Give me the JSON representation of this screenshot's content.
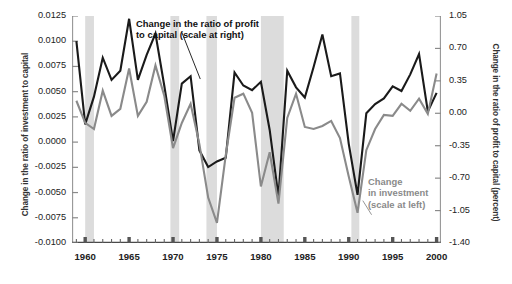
{
  "chart_data": {
    "type": "line",
    "title": "",
    "xlabel": "",
    "grid": false,
    "legend_position": "inline-annotations",
    "x": [
      1959,
      1960,
      1961,
      1962,
      1963,
      1964,
      1965,
      1966,
      1967,
      1968,
      1969,
      1970,
      1971,
      1972,
      1973,
      1974,
      1975,
      1976,
      1977,
      1978,
      1979,
      1980,
      1981,
      1982,
      1983,
      1984,
      1985,
      1986,
      1987,
      1988,
      1989,
      1990,
      1991,
      1992,
      1993,
      1994,
      1995,
      1996,
      1997,
      1998,
      1999,
      2000
    ],
    "xlim": [
      1958.5,
      2000.5
    ],
    "xticks_major": [
      1960,
      1965,
      1970,
      1975,
      1980,
      1985,
      1990,
      1995,
      2000
    ],
    "xtick_labels": [
      "1960",
      "1965",
      "1970",
      "1975",
      "1980",
      "1985",
      "1990",
      "1995",
      "2000"
    ],
    "left_axis": {
      "label": "Change in the ratio of investment to capital",
      "ticks": [
        0.0125,
        0.01,
        0.0075,
        0.005,
        0.0025,
        0.0,
        -0.0025,
        -0.005,
        -0.0075,
        -0.01
      ],
      "tick_labels": [
        "0.0125",
        "0.0100",
        "0.0075",
        "0.0050",
        "0.0025",
        "0.0000",
        "-0.0025",
        "-0.0050",
        "-0.0075",
        "-0.0100"
      ],
      "lim": [
        -0.01,
        0.0125
      ]
    },
    "right_axis": {
      "label": "Change in the ratio of profit to capital (percent)",
      "ticks": [
        1.05,
        0.7,
        0.35,
        0.0,
        -0.35,
        -0.7,
        -1.05,
        -1.4
      ],
      "tick_labels": [
        "1.05",
        "0.70",
        "0.35",
        "0.00",
        "-0.35",
        "-0.70",
        "-1.05",
        "-1.40"
      ],
      "lim": [
        -1.4,
        1.05
      ]
    },
    "series": [
      {
        "name": "Change in the ratio of profit to capital (scale at right)",
        "axis": "right",
        "color": "#1a1a1a",
        "values": [
          0.78,
          -0.12,
          0.18,
          0.6,
          0.36,
          0.46,
          1.02,
          0.36,
          0.63,
          0.86,
          0.3,
          -0.3,
          0.32,
          0.4,
          -0.4,
          -0.58,
          -0.52,
          -0.48,
          0.44,
          0.3,
          0.25,
          0.34,
          -0.18,
          -0.9,
          0.46,
          0.28,
          0.17,
          0.5,
          0.85,
          0.4,
          0.43,
          -0.33,
          -0.88,
          0.0,
          0.1,
          0.16,
          0.29,
          0.24,
          0.42,
          0.64,
          0.02,
          0.22
        ]
      },
      {
        "name": "Change in investment (scale at left)",
        "axis": "left",
        "color": "#8a8a8a",
        "values": [
          0.0041,
          0.0019,
          0.0013,
          0.0051,
          0.0026,
          0.0033,
          0.0073,
          0.0026,
          0.004,
          0.0076,
          0.0046,
          -0.0006,
          0.0019,
          0.0038,
          -0.0002,
          -0.0055,
          -0.008,
          -0.0013,
          0.0044,
          0.0048,
          0.0029,
          -0.0044,
          -0.001,
          -0.0061,
          0.0024,
          0.0048,
          0.0015,
          0.0013,
          0.0016,
          0.0021,
          0.0004,
          -0.0034,
          -0.007,
          -0.0008,
          0.0013,
          0.0027,
          0.0026,
          0.0038,
          0.0031,
          0.0043,
          0.0028,
          0.0068
        ]
      }
    ],
    "recession_bands": [
      {
        "start": 1960.0,
        "end": 1961.0
      },
      {
        "start": 1969.7,
        "end": 1970.7
      },
      {
        "start": 1973.8,
        "end": 1975.0
      },
      {
        "start": 1980.0,
        "end": 1982.6
      },
      {
        "start": 1990.3,
        "end": 1991.2
      }
    ],
    "band_color": "#dcdcdc",
    "annotations": [
      {
        "id": "profit",
        "text": "Change in the ratio of profit\nto capital (scale at right)",
        "color": "#111111",
        "leader": {
          "x1": 1971.0,
          "y1": 0.0104,
          "x2": 1973.1,
          "y2": 0.0044
        }
      },
      {
        "id": "investment",
        "text": "Change\nin investment\n(scale at left)",
        "color": "#8a8a8a",
        "leader": {
          "x1": 1991.6,
          "y1": -0.0058,
          "x2": 1992.6,
          "y2": -0.0072
        }
      }
    ]
  }
}
